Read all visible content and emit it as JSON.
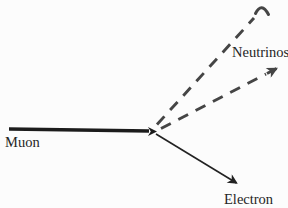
{
  "diagram": {
    "labels": {
      "muon": "Muon",
      "neutrinos": "Neutrinos",
      "electron": "Electron"
    },
    "colors": {
      "background": "#fcfcfc",
      "muon_line": "#1c1c1c",
      "neutrino_dash": "#454545",
      "electron_line": "#222222",
      "text": "#252525"
    }
  }
}
